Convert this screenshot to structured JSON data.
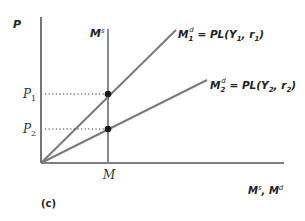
{
  "figure": {
    "panel_label": "(c)",
    "y_axis_label": "P",
    "x_axis_label": "Mˢ, Mᵈ",
    "x_axis_label_parts": {
      "m1": "M",
      "s": "s",
      "sep": ", ",
      "m2": "M",
      "d": "d"
    },
    "supply_label": {
      "m": "M",
      "s": "s"
    },
    "money_tick_label": "M",
    "price_ticks": [
      {
        "p": "P",
        "sub": "1"
      },
      {
        "p": "P",
        "sub": "2"
      }
    ],
    "demand_curves": [
      {
        "m": "M",
        "sub": "1",
        "sup": "d",
        "eq": " = PL(Y",
        "ysub": "1",
        "mid": ", r",
        "rsub": "1",
        "end": ")"
      },
      {
        "m": "M",
        "sub": "2",
        "sup": "d",
        "eq": " = PL(Y",
        "ysub": "2",
        "mid": ", r",
        "rsub": "2",
        "end": ")"
      }
    ],
    "colors": {
      "axis": "#555555",
      "curve": "#7a7a7a",
      "dot": "#1a1a1a",
      "text": "#222222"
    }
  }
}
